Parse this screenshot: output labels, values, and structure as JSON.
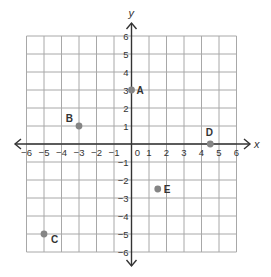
{
  "chart_data": {
    "type": "scatter",
    "title": "",
    "xlabel": "x",
    "ylabel": "y",
    "xlim": [
      -6,
      6
    ],
    "ylim": [
      -6,
      6
    ],
    "grid": true,
    "x_ticks": [
      -6,
      -5,
      -4,
      -3,
      -2,
      -1,
      0,
      1,
      2,
      3,
      4,
      5,
      6
    ],
    "y_ticks": [
      -6,
      -5,
      -4,
      -3,
      -2,
      -1,
      1,
      2,
      3,
      4,
      5,
      6
    ],
    "points": [
      {
        "label": "A",
        "x": 0,
        "y": 3
      },
      {
        "label": "B",
        "x": -3,
        "y": 1
      },
      {
        "label": "C",
        "x": -5,
        "y": -5
      },
      {
        "label": "D",
        "x": 4.5,
        "y": 0
      },
      {
        "label": "E",
        "x": 1.5,
        "y": -2.5
      }
    ]
  },
  "colors": {
    "grid": "#a8a8a8",
    "axis": "#333333",
    "point": "#858585"
  }
}
